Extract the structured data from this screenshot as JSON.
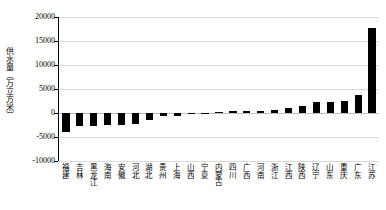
{
  "chart_data": {
    "type": "bar",
    "title": "",
    "xlabel": "",
    "ylabel": "供水量（万立方米）",
    "ylim": [
      -10000,
      20000
    ],
    "ytick_values": [
      20000,
      15000,
      10000,
      5000,
      0,
      -5000,
      -10000
    ],
    "ytick_labels": [
      "20000",
      "15000",
      "10000",
      "5000",
      "0",
      "-5000",
      "-10000"
    ],
    "grid": true,
    "legend": "none",
    "bar_color": "#000000",
    "categories": [
      "福建",
      "吉林",
      "黑龙江",
      "海南",
      "安徽",
      "河北",
      "湖北",
      "贵州",
      "上海",
      "山西",
      "宁夏",
      "内蒙古",
      "四川",
      "广西",
      "河南",
      "浙江",
      "江西",
      "陕西",
      "辽宁",
      "山东",
      "重庆",
      "广东",
      "江苏"
    ],
    "values": [
      -4000,
      -2800,
      -2700,
      -2450,
      -2400,
      -2350,
      -1500,
      -700,
      -600,
      -120,
      -60,
      200,
      420,
      500,
      520,
      560,
      1100,
      1400,
      2200,
      2300,
      2500,
      3700,
      17800
    ]
  },
  "axis": {
    "y_title": "供水量（万立方米）"
  }
}
